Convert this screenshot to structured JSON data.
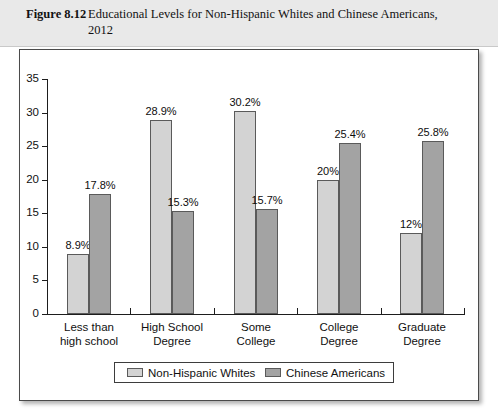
{
  "caption": {
    "figure_number": "Figure 8.12",
    "title": "Educational Levels for Non-Hispanic Whites and Chinese Americans, 2012"
  },
  "chart_data": {
    "type": "bar",
    "title": "Educational Levels for Non-Hispanic Whites and Chinese Americans, 2012",
    "xlabel": "",
    "ylabel": "",
    "ylim": [
      0,
      35
    ],
    "yticks": [
      "0",
      "5",
      "10",
      "15",
      "20",
      "25",
      "30",
      "35"
    ],
    "ytick_values": [
      0,
      5,
      10,
      15,
      20,
      25,
      30,
      35
    ],
    "grid": false,
    "legend_position": "bottom",
    "categories": [
      "Less than high school",
      "High School Degree",
      "Some College",
      "College Degree",
      "Graduate Degree"
    ],
    "category_lines": [
      [
        "Less than",
        "high school"
      ],
      [
        "High School",
        "Degree"
      ],
      [
        "Some",
        "College"
      ],
      [
        "College",
        "Degree"
      ],
      [
        "Graduate",
        "Degree"
      ]
    ],
    "series": [
      {
        "name": "Non-Hispanic Whites",
        "color": "#d3d3d3",
        "values": [
          8.9,
          28.9,
          30.2,
          20,
          12
        ],
        "labels": [
          "8.9%",
          "28.9%",
          "30.2%",
          "20%",
          "12%"
        ]
      },
      {
        "name": "Chinese Americans",
        "color": "#a3a3a3",
        "values": [
          17.8,
          15.3,
          15.7,
          25.4,
          25.8
        ],
        "labels": [
          "17.8%",
          "15.3%",
          "15.7%",
          "25.4%",
          "25.8%"
        ]
      }
    ]
  }
}
